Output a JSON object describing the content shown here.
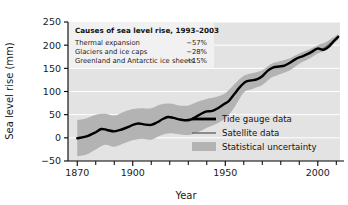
{
  "chart_data": {
    "type": "line",
    "title": "",
    "xlabel": "Year",
    "ylabel": "Sea level rise (mm)",
    "xlim": [
      1865,
      2012
    ],
    "ylim": [
      -50,
      250
    ],
    "xticks_major": [
      1870,
      1900,
      1950,
      2000
    ],
    "xticks_major_labels": [
      "1870",
      "1900",
      "1950",
      "2000"
    ],
    "xticks_minor": [
      1880,
      1890,
      1910,
      1920,
      1930,
      1940,
      1960,
      1970,
      1980,
      1990,
      2010
    ],
    "yticks": [
      -50,
      0,
      50,
      100,
      150,
      200,
      250
    ],
    "ytick_labels": [
      "−50",
      "0",
      "50",
      "100",
      "150",
      "200",
      "250"
    ],
    "grid": "horizontal-white",
    "legend_position": "lower-right-inside",
    "series": [
      {
        "name": "Tide gauge data",
        "style": "thick-black-line",
        "color": "#000000",
        "x": [
          1870,
          1875,
          1880,
          1883,
          1886,
          1890,
          1894,
          1898,
          1900,
          1903,
          1906,
          1910,
          1913,
          1916,
          1919,
          1922,
          1925,
          1928,
          1931,
          1934,
          1937,
          1940,
          1943,
          1946,
          1949,
          1952,
          1955,
          1958,
          1961,
          1964,
          1967,
          1970,
          1973,
          1976,
          1979,
          1982,
          1985,
          1988,
          1991,
          1994,
          1997,
          2000,
          2003,
          2006,
          2009,
          2011
        ],
        "y": [
          -1,
          3,
          12,
          19,
          17,
          14,
          18,
          24,
          28,
          31,
          29,
          28,
          33,
          40,
          45,
          43,
          40,
          38,
          39,
          45,
          52,
          57,
          58,
          64,
          72,
          80,
          95,
          110,
          121,
          124,
          126,
          133,
          145,
          152,
          154,
          156,
          162,
          170,
          175,
          180,
          186,
          193,
          190,
          197,
          210,
          218
        ]
      },
      {
        "name": "Satellite data",
        "style": "thin-gray-line",
        "color": "#6e6e6e",
        "x": [
          1993,
          1996,
          1999,
          2002,
          2005,
          2008,
          2011
        ],
        "y": [
          178,
          185,
          192,
          191,
          198,
          208,
          219
        ]
      }
    ],
    "uncertainty_band": {
      "name": "Statistical uncertainty",
      "color": "#b3b3b3",
      "x": [
        1870,
        1875,
        1880,
        1885,
        1890,
        1895,
        1900,
        1905,
        1910,
        1915,
        1920,
        1925,
        1930,
        1935,
        1940,
        1945,
        1950,
        1955,
        1960,
        1965,
        1970,
        1975,
        1980,
        1985,
        1990,
        1995,
        2000,
        2005,
        2011
      ],
      "upper": [
        38,
        42,
        50,
        52,
        48,
        56,
        62,
        64,
        64,
        72,
        74,
        70,
        70,
        78,
        84,
        88,
        96,
        116,
        134,
        140,
        146,
        160,
        166,
        172,
        182,
        190,
        200,
        208,
        224
      ],
      "lower": [
        -40,
        -36,
        -25,
        -15,
        -19,
        -12,
        -5,
        -2,
        -4,
        5,
        10,
        8,
        6,
        12,
        22,
        30,
        42,
        66,
        98,
        106,
        114,
        130,
        138,
        146,
        160,
        170,
        182,
        190,
        212
      ]
    },
    "annotations": {
      "inset": {
        "title": "Causes of sea level rise, 1993–2003",
        "rows": [
          {
            "label": "Thermal expansion",
            "value": "~57%"
          },
          {
            "label": "Glaciers and ice caps",
            "value": "~28%"
          },
          {
            "label": "Greenland and Antarctic ice sheets",
            "value": "~15%"
          }
        ]
      }
    },
    "legend": [
      {
        "label": "Tide gauge data",
        "marker": "thick-black-line",
        "color": "#000000"
      },
      {
        "label": "Satellite data",
        "marker": "thin-gray-line",
        "color": "#6e6e6e"
      },
      {
        "label": "Statistical uncertainty",
        "marker": "gray-swatch",
        "color": "#b8b8b8"
      }
    ],
    "colors": {
      "plot_background": "#e3e3e3",
      "inset_background": "#f1f1f1",
      "gridline": "#ffffff",
      "axis": "#000000",
      "band": "#b3b3b3",
      "tide_line": "#000000",
      "satellite_line": "#6e6e6e"
    }
  }
}
